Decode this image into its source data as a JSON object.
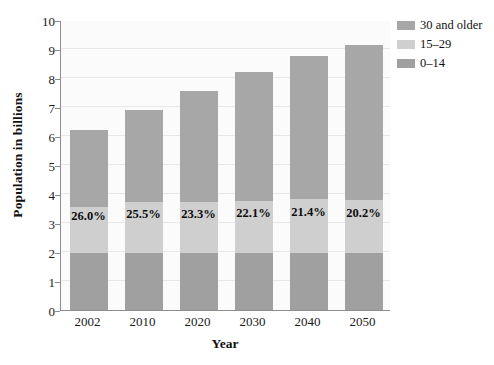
{
  "chart_data": {
    "type": "bar",
    "subtype": "stacked-bar",
    "title": "",
    "xlabel": "Year",
    "ylabel": "Population in billions",
    "categories": [
      "2002",
      "2010",
      "2020",
      "2030",
      "2040",
      "2050"
    ],
    "ylim": [
      0,
      10
    ],
    "yticks": [
      "0",
      "1",
      "2",
      "3",
      "4",
      "5",
      "6",
      "7",
      "8",
      "9",
      "10"
    ],
    "grid": true,
    "legend_position": "top-right",
    "series": [
      {
        "name": "0–14",
        "color": "#a0a0a0",
        "values": [
          1.95,
          1.95,
          1.95,
          1.95,
          1.95,
          1.95
        ]
      },
      {
        "name": "15–29",
        "color": "#cfcfcf",
        "values": [
          1.6,
          1.76,
          1.76,
          1.81,
          1.87,
          1.85
        ]
      },
      {
        "name": "30 and older",
        "color": "#a7a7a7",
        "values": [
          2.65,
          3.19,
          3.84,
          4.44,
          4.93,
          5.35
        ]
      }
    ],
    "totals": [
      6.2,
      6.9,
      7.55,
      8.2,
      8.75,
      9.15
    ],
    "data_labels": [
      "26.0%",
      "25.5%",
      "23.3%",
      "22.1%",
      "21.4%",
      "20.2%"
    ]
  },
  "legend": {
    "entries": [
      {
        "label": "30 and older",
        "color": "#a7a7a7"
      },
      {
        "label": "15–29",
        "color": "#cfcfcf"
      },
      {
        "label": "0–14",
        "color": "#a0a0a0"
      }
    ]
  },
  "colors": {
    "plot_background": "#fbfbfb",
    "gridline": "#e7e7e7",
    "axis": "#8d8d8d",
    "text": "#111111"
  }
}
